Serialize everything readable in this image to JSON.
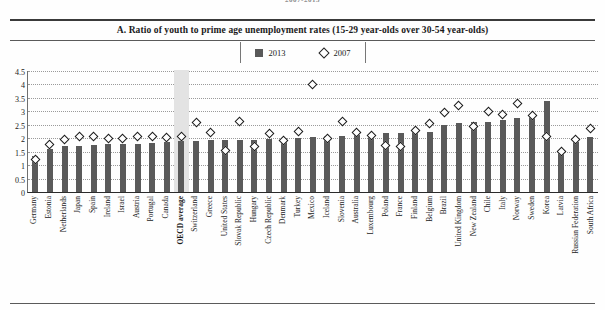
{
  "running_head": "2007-2013",
  "chart_title": "A. Ratio of youth to prime age unemployment rates (15-29 year-olds over 30-54 year-olds)",
  "legend": [
    {
      "key": "bar",
      "label": "2013",
      "marker": "filled-square",
      "color": "#5a5a5a"
    },
    {
      "key": "diamond",
      "label": "2007",
      "marker": "open-diamond",
      "color": "#ffffff"
    }
  ],
  "highlight": {
    "category": "OECD average",
    "color": "#e3e3e3"
  },
  "chart_data": {
    "type": "bar",
    "title": "A. Ratio of youth to prime age unemployment rates (15-29 year-olds over 30-54 year-olds)",
    "xlabel": "",
    "ylabel": "",
    "ylim": [
      0,
      4.5
    ],
    "yticks": [
      0,
      0.5,
      1,
      1.5,
      2,
      2.5,
      3,
      3.5,
      4,
      4.5
    ],
    "ytick_labels": [
      "0",
      "0.5",
      "1",
      "1.5",
      "2",
      "2.5",
      "3",
      "3.5",
      "4",
      "4.5"
    ],
    "grid": true,
    "legend_position": "top-center",
    "categories": [
      "Germany",
      "Estonia",
      "Netherlands",
      "Japan",
      "Spain",
      "Ireland",
      "Israel",
      "Austria",
      "Portugal",
      "Canada",
      "OECD average",
      "Switzerland",
      "Greece",
      "United States",
      "Slovak Republic",
      "Hungary",
      "Czech Republic",
      "Denmark",
      "Turkey",
      "Mexico",
      "Iceland",
      "Slovenia",
      "Australia",
      "Luxembourg",
      "Poland",
      "France",
      "Finland",
      "Belgium",
      "Brazil",
      "United Kingdom",
      "New Zealand",
      "Chile",
      "Italy",
      "Norway",
      "Sweden",
      "Korea",
      "Latvia",
      "Russian Federation",
      "South Africa"
    ],
    "series": [
      {
        "name": "2013",
        "marker": "bar",
        "values": [
          1.35,
          1.6,
          1.7,
          1.72,
          1.75,
          1.78,
          1.8,
          1.8,
          1.82,
          1.85,
          1.9,
          1.9,
          1.92,
          1.93,
          1.95,
          1.95,
          1.98,
          2.0,
          2.02,
          2.05,
          2.08,
          2.1,
          2.12,
          2.15,
          2.18,
          2.2,
          2.22,
          2.25,
          2.5,
          2.55,
          2.6,
          2.62,
          2.68,
          2.75,
          2.9,
          3.4,
          1.5,
          1.85,
          2.05
        ]
      },
      {
        "name": "2007",
        "marker": "diamond",
        "values": [
          1.2,
          1.75,
          1.95,
          2.05,
          2.05,
          2.0,
          1.98,
          2.05,
          2.05,
          2.02,
          2.05,
          2.58,
          2.2,
          1.55,
          2.62,
          1.7,
          2.18,
          1.92,
          2.25,
          4.0,
          2.0,
          2.62,
          2.22,
          2.1,
          1.72,
          1.7,
          2.3,
          2.55,
          2.95,
          3.2,
          2.45,
          3.0,
          2.9,
          3.3,
          2.85,
          2.05,
          1.5,
          1.95,
          2.35
        ]
      }
    ]
  }
}
